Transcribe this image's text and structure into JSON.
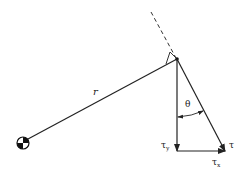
{
  "diagram": {
    "labels": {
      "radius": "r",
      "angle": "θ",
      "torque": "τ",
      "torque_y_base": "τ",
      "torque_y_sub": "y",
      "torque_x_base": "τ",
      "torque_x_sub": "x"
    },
    "elements": {
      "center_of_mass": "center-of-mass symbol",
      "lever_arm": "radius line r",
      "perpendicular_line": "dashed perpendicular extension",
      "right_angle_marker": "right angle square",
      "torque_vector": "τ",
      "component_y": "τy",
      "component_x": "τx"
    },
    "colors": {
      "stroke": "#222222",
      "background": "#ffffff"
    }
  }
}
